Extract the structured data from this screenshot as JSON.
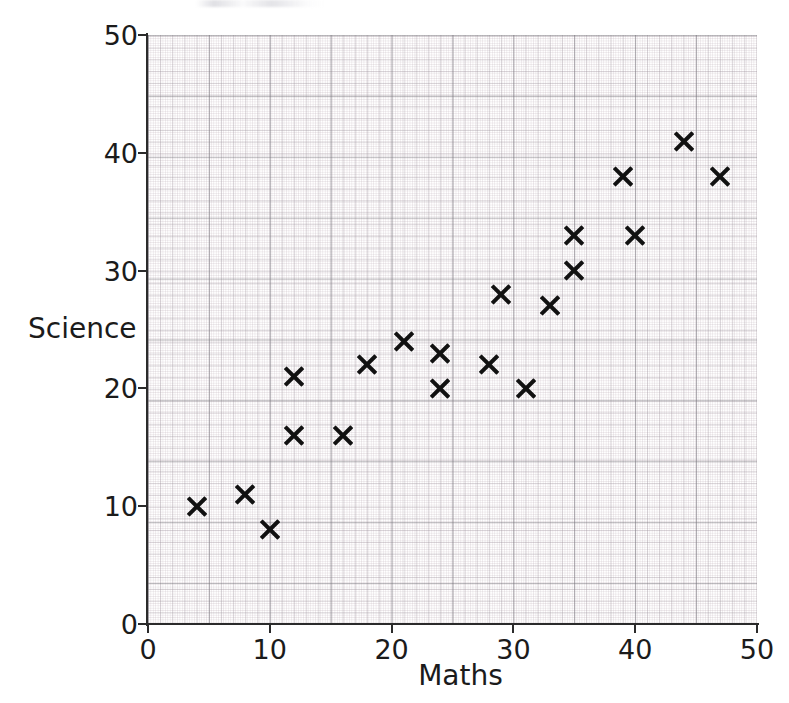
{
  "chart_data": {
    "type": "scatter",
    "title": "",
    "xlabel": "Maths",
    "ylabel": "Science",
    "xlim": [
      0,
      50
    ],
    "ylim": [
      0,
      50
    ],
    "xticks": [
      0,
      10,
      20,
      30,
      40,
      50
    ],
    "yticks": [
      0,
      10,
      20,
      30,
      40,
      50
    ],
    "xtick_labels": [
      "0",
      "10",
      "20",
      "30",
      "40",
      "50"
    ],
    "ytick_labels": [
      "0",
      "10",
      "20",
      "30",
      "40",
      "50"
    ],
    "grid": true,
    "grid_style": "graph-paper (0.2 / 1 / 5 unit squares)",
    "legend": null,
    "marker": "x",
    "marker_color": "#111111",
    "points": [
      {
        "x": 4,
        "y": 10
      },
      {
        "x": 8,
        "y": 11
      },
      {
        "x": 10,
        "y": 8
      },
      {
        "x": 12,
        "y": 21
      },
      {
        "x": 12,
        "y": 16
      },
      {
        "x": 16,
        "y": 16
      },
      {
        "x": 18,
        "y": 22
      },
      {
        "x": 21,
        "y": 24
      },
      {
        "x": 24,
        "y": 23
      },
      {
        "x": 24,
        "y": 20
      },
      {
        "x": 28,
        "y": 22
      },
      {
        "x": 29,
        "y": 28
      },
      {
        "x": 31,
        "y": 20
      },
      {
        "x": 33,
        "y": 27
      },
      {
        "x": 35,
        "y": 33
      },
      {
        "x": 35,
        "y": 30
      },
      {
        "x": 39,
        "y": 38
      },
      {
        "x": 40,
        "y": 33
      },
      {
        "x": 44,
        "y": 41
      },
      {
        "x": 47,
        "y": 38
      }
    ],
    "n_points": 20
  },
  "axes": {
    "x_title": "Maths",
    "y_title": "Science",
    "x_tick_labels": [
      "0",
      "10",
      "20",
      "30",
      "40",
      "50"
    ],
    "y_tick_labels": [
      "0",
      "10",
      "20",
      "30",
      "40",
      "50"
    ]
  },
  "colors": {
    "marker": "#111111",
    "axis": "#2b2b2b",
    "text": "#1b1b1b",
    "grid_major": "#78767d",
    "grid_minor": "#b2a0ac",
    "background": "#ffffff"
  }
}
